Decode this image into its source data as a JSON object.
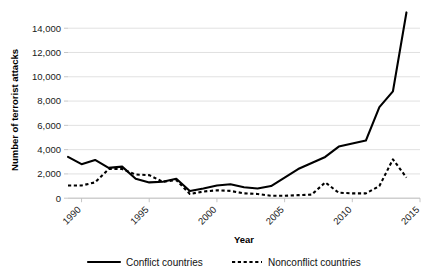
{
  "chart_data": {
    "type": "line",
    "title": "",
    "xlabel": "Year",
    "ylabel": "Number of terrorist attacks",
    "xlim": [
      1989,
      2015
    ],
    "ylim": [
      0,
      15500
    ],
    "ytick_values": [
      0,
      2000,
      4000,
      6000,
      8000,
      10000,
      12000,
      14000
    ],
    "ytick_labels": [
      "0",
      "2,000",
      "4,000",
      "6,000",
      "8,000",
      "10,000",
      "12,000",
      "14,000"
    ],
    "xtick_values": [
      1990,
      1995,
      2000,
      2005,
      2010,
      2015
    ],
    "xtick_labels": [
      "1990",
      "1995",
      "2000",
      "2005",
      "2010",
      "2015"
    ],
    "xtick_rotation": -45,
    "grid": "horizontal",
    "legend_position": "bottom",
    "x": [
      1989,
      1990,
      1991,
      1992,
      1993,
      1994,
      1995,
      1996,
      1997,
      1998,
      1999,
      2000,
      2001,
      2002,
      2003,
      2004,
      2005,
      2006,
      2007,
      2008,
      2009,
      2010,
      2011,
      2012,
      2013,
      2014
    ],
    "series": [
      {
        "name": "Conflict countries",
        "style": "solid",
        "color": "#000000",
        "values": [
          3400,
          2800,
          3150,
          2500,
          2600,
          1600,
          1300,
          1350,
          1600,
          600,
          800,
          1050,
          1150,
          900,
          800,
          1000,
          1700,
          2400,
          2900,
          3400,
          4250,
          4500,
          4750,
          7500,
          8800,
          15300
        ]
      },
      {
        "name": "Nonconflict countries",
        "style": "dotted",
        "color": "#000000",
        "values": [
          1050,
          1050,
          1300,
          2400,
          2400,
          1950,
          1900,
          1350,
          1500,
          350,
          550,
          650,
          600,
          400,
          350,
          200,
          200,
          250,
          300,
          1300,
          450,
          400,
          400,
          1000,
          3200,
          1700
        ]
      }
    ]
  },
  "legend": {
    "items": [
      {
        "label": "Conflict countries",
        "marker": "solid-line"
      },
      {
        "label": "Nonconflict countries",
        "marker": "dotted-line"
      }
    ]
  },
  "axes": {
    "y_title": "Number of terrorist attacks",
    "x_title": "Year"
  }
}
